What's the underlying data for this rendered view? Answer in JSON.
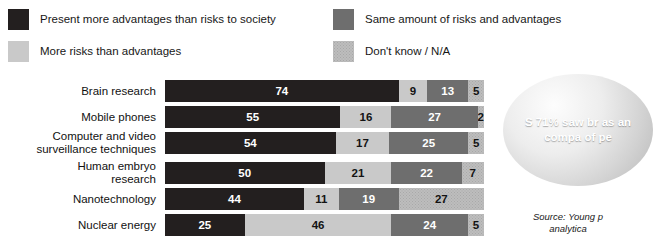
{
  "legend": {
    "items": [
      {
        "label": "Present more advantages than risks to society",
        "swatch": "dark-swatch-icon",
        "color": "#231f1f"
      },
      {
        "label": "More risks than advantages",
        "swatch": "light-gray-swatch-icon",
        "color": "#c9c9c9"
      },
      {
        "label": "Same amount of risks and advantages",
        "swatch": "mid-gray-swatch-icon",
        "color": "#6e6e6e"
      },
      {
        "label": "Don't know / N/A",
        "swatch": "dotted-gray-swatch-icon",
        "color": "#bdbdbd"
      }
    ]
  },
  "callout": {
    "line1": "S",
    "line2": "71%",
    "line3": "saw br",
    "line4": "as  an",
    "line5": "compa",
    "line6": "of  pe",
    "text": "S\n71%\nsaw br\nas  an\ncompa\nof  pe"
  },
  "source": {
    "text": "Source: Young p\nanalytica"
  },
  "chart_data": {
    "type": "bar",
    "orientation": "horizontal",
    "stacked": true,
    "percent": true,
    "title": "",
    "subtitle": "",
    "xlabel": "",
    "ylabel": "",
    "xlim": [
      0,
      100
    ],
    "grid": false,
    "legend_position": "top",
    "categories": [
      "Brain research",
      "Mobile phones",
      "Computer and video\nsurveillance techniques",
      "Human embryo\nresearch",
      "Nanotechnology",
      "Nuclear energy"
    ],
    "series": [
      {
        "name": "Present more advantages than risks to society",
        "color": "#231f1f",
        "values": [
          74,
          55,
          54,
          50,
          44,
          25
        ]
      },
      {
        "name": "More risks than advantages",
        "color": "#c9c9c9",
        "values": [
          9,
          16,
          17,
          21,
          11,
          46
        ]
      },
      {
        "name": "Same amount of risks and advantages",
        "color": "#6e6e6e",
        "values": [
          13,
          27,
          25,
          22,
          19,
          24
        ]
      },
      {
        "name": "Don't know / N/A",
        "color": "#bdbdbd",
        "values": [
          5,
          2,
          5,
          7,
          27,
          5
        ]
      }
    ],
    "rows": [
      {
        "label": "Brain research",
        "segments": [
          {
            "value": 74,
            "style": "t-dark"
          },
          {
            "value": 9,
            "style": "t-light"
          },
          {
            "value": 13,
            "style": "t-mid"
          },
          {
            "value": 5,
            "style": "t-dot"
          }
        ]
      },
      {
        "label": "Mobile phones",
        "segments": [
          {
            "value": 55,
            "style": "t-dark"
          },
          {
            "value": 16,
            "style": "t-light"
          },
          {
            "value": 27,
            "style": "t-mid"
          },
          {
            "value": 2,
            "style": "t-dot"
          }
        ]
      },
      {
        "label": "Computer and video\nsurveillance techniques",
        "segments": [
          {
            "value": 54,
            "style": "t-dark"
          },
          {
            "value": 17,
            "style": "t-light"
          },
          {
            "value": 25,
            "style": "t-mid"
          },
          {
            "value": 5,
            "style": "t-dot"
          }
        ]
      },
      {
        "label": "Human embryo\nresearch",
        "segments": [
          {
            "value": 50,
            "style": "t-dark"
          },
          {
            "value": 21,
            "style": "t-light"
          },
          {
            "value": 22,
            "style": "t-mid"
          },
          {
            "value": 7,
            "style": "t-dot"
          }
        ]
      },
      {
        "label": "Nanotechnology",
        "segments": [
          {
            "value": 44,
            "style": "t-dark"
          },
          {
            "value": 11,
            "style": "t-light"
          },
          {
            "value": 19,
            "style": "t-mid"
          },
          {
            "value": 27,
            "style": "t-dot"
          }
        ]
      },
      {
        "label": "Nuclear energy",
        "segments": [
          {
            "value": 25,
            "style": "t-dark"
          },
          {
            "value": 46,
            "style": "t-light"
          },
          {
            "value": 24,
            "style": "t-mid"
          },
          {
            "value": 5,
            "style": "t-dot"
          }
        ]
      }
    ]
  }
}
